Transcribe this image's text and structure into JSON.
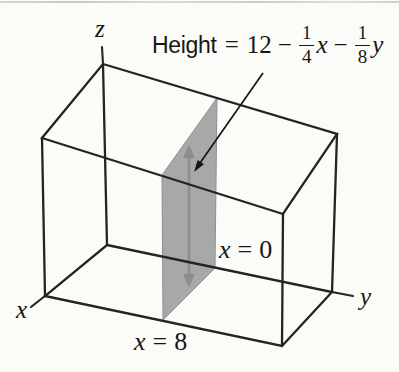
{
  "figure": {
    "colors": {
      "background": "#fbfbf8",
      "box_line": "#242424",
      "slab_fill": "#a8a8a8",
      "slab_edge": "#8f8f8f",
      "dimension_arrow": "#8d8d8d",
      "annotation_arrow": "#161616",
      "text": "#161616",
      "scan_rule": "#c4c4c0"
    }
  },
  "formula": {
    "label": "Height",
    "equals": "=",
    "number": "12",
    "minus_1": "−",
    "fraction_1": {
      "numerator": "1",
      "denominator": "4"
    },
    "variable_1": "x",
    "minus_2": "−",
    "fraction_2": {
      "numerator": "1",
      "denominator": "8"
    },
    "variable_2": "y"
  },
  "plane_labels": {
    "back": {
      "variable": "x",
      "equals": "=",
      "value": "0"
    },
    "front": {
      "variable": "x",
      "equals": "=",
      "value": "8"
    }
  },
  "axes": {
    "x": "x",
    "y": "y",
    "z": "z"
  }
}
